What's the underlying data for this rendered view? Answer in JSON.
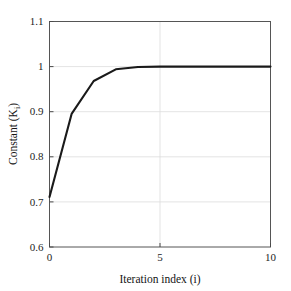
{
  "chart_data": {
    "type": "line",
    "title": "",
    "xlabel": "Iteration index (i)",
    "ylabel": "Constant (K",
    "ylabel_sub": "i",
    "ylabel_tail": ")",
    "xlim": [
      0,
      10
    ],
    "ylim": [
      0.6,
      1.1
    ],
    "grid": true,
    "legend": "none",
    "xticks": [
      0,
      5,
      10
    ],
    "xtick_labels": [
      "0",
      "5",
      "10"
    ],
    "yticks": [
      0.6,
      0.7,
      0.8,
      0.9,
      1.0,
      1.1
    ],
    "ytick_labels": [
      "0.6",
      "0.7",
      "0.8",
      "0.9",
      "1",
      "1.1"
    ],
    "series": [
      {
        "name": "K_i",
        "color": "#1a1a1a",
        "line_width": 2.1,
        "x": [
          0,
          1,
          2,
          3,
          4,
          5,
          6,
          7,
          8,
          9,
          10
        ],
        "values": [
          0.711,
          0.895,
          0.968,
          0.994,
          0.999,
          1.0,
          1.0,
          1.0,
          1.0,
          1.0,
          1.0
        ]
      }
    ]
  },
  "style": {
    "background": "#ffffff",
    "axis_color": "#4a4a4a",
    "grid_color": "#dcdcdc",
    "text_color": "#1a1a1a"
  }
}
